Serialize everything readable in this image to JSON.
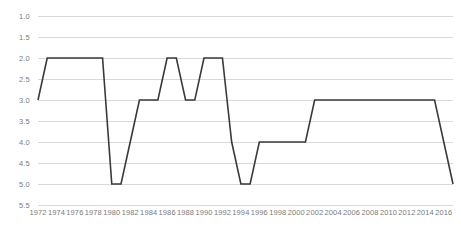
{
  "chart_data": {
    "type": "line",
    "title": "",
    "subtitle": "",
    "xlabel": "",
    "ylabel": "",
    "grid": true,
    "legend": "none",
    "y_axis_inverted": true,
    "ylim": [
      1.0,
      5.5
    ],
    "y_ticks": [
      "1.0",
      "1.5",
      "2.0",
      "2.5",
      "3.0",
      "3.5",
      "4.0",
      "4.5",
      "5.0",
      "5.5"
    ],
    "y_tick_values": [
      1.0,
      1.5,
      2.0,
      2.5,
      3.0,
      3.5,
      4.0,
      4.5,
      5.0,
      5.5
    ],
    "xlim": [
      1972,
      2017
    ],
    "x_ticks": [
      "1972",
      "1974",
      "1976",
      "1978",
      "1980",
      "1982",
      "1984",
      "1986",
      "1988",
      "1990",
      "1992",
      "1994",
      "1996",
      "1998",
      "2000",
      "2002",
      "2004",
      "2006",
      "2008",
      "2010",
      "2012",
      "2014",
      "2016"
    ],
    "x_tick_values": [
      1972,
      1974,
      1976,
      1978,
      1980,
      1982,
      1984,
      1986,
      1988,
      1990,
      1992,
      1994,
      1996,
      1998,
      2000,
      2002,
      2004,
      2006,
      2008,
      2010,
      2012,
      2014,
      2016
    ],
    "series": [
      {
        "name": "",
        "color": "#3a3a3a",
        "x": [
          1972,
          1973,
          1974,
          1975,
          1976,
          1977,
          1978,
          1979,
          1980,
          1981,
          1982,
          1983,
          1984,
          1985,
          1986,
          1987,
          1988,
          1989,
          1990,
          1991,
          1992,
          1993,
          1994,
          1995,
          1996,
          1997,
          1998,
          1999,
          2000,
          2001,
          2002,
          2003,
          2004,
          2005,
          2006,
          2007,
          2008,
          2009,
          2010,
          2011,
          2012,
          2013,
          2014,
          2015,
          2016,
          2017
        ],
        "values": [
          3,
          2,
          2,
          2,
          2,
          2,
          2,
          2,
          5,
          5,
          4,
          3,
          3,
          3,
          2,
          2,
          3,
          3,
          2,
          2,
          2,
          4,
          5,
          5,
          4,
          4,
          4,
          4,
          4,
          4,
          3,
          3,
          3,
          3,
          3,
          3,
          3,
          3,
          3,
          3,
          3,
          3,
          3,
          3,
          4,
          5
        ]
      }
    ]
  },
  "colors": {
    "line": "#3a3a3a",
    "gridline": "#d9d9d9",
    "tick_label": "#7b7b7b",
    "background": "#ffffff"
  }
}
